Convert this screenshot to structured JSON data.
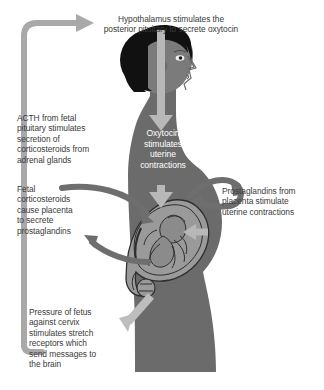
{
  "diagram": {
    "title_text": "Hypothalamus stimulates the\nposterior pituitary to secrete oxytocin",
    "labels": {
      "acth": "ACTH from fetal\npituitary stimulates\nsecretion of\ncorticosteroids from\nadrenal glands",
      "fetal_corticosteroids": "Fetal\ncorticosteroids\ncause placenta\nto secrete\nprostaglandins",
      "pressure": "Pressure of fetus\nagainst cervix\nstimulates stretch\nreceptors which\nsend messages to\nthe brain",
      "prostaglandins": "Prostaglandins from\nplacenta stimulate\nuterine contractions",
      "oxytocin": "Oxytocin\nstimulates\nuterine\ncontractions"
    },
    "colors": {
      "background": "#ffffff",
      "text": "#3b3b3b",
      "text_on_body": "#ffffff",
      "body_fill": "#6b6b6b",
      "hair_fill": "#111111",
      "uterus_fill": "#9a9a9a",
      "uterus_outline": "#2e2e2e",
      "fetus_fill": "#8b8b8b",
      "arrow_light": "#b3b3b3",
      "arrow_mid": "#a8a8a8",
      "arrow_dark": "#6e6e6e",
      "loop_arrow": "#a9a9a9"
    },
    "icons": {
      "feedback_loop": "feedback-loop-arrow",
      "oxytocin_flow": "down-arrow",
      "cervix_signal": "down-left-arrow",
      "placenta_in": "curved-arrow-right",
      "placenta_out": "curved-arrow-left",
      "prostaglandin_loop": "curved-loop-arrow"
    }
  }
}
